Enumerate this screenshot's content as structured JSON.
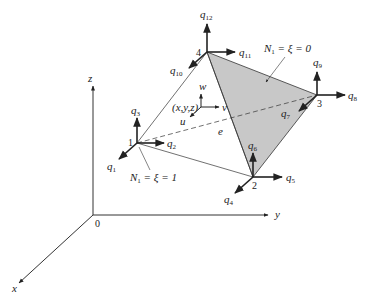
{
  "diagram": {
    "axes": {
      "origin_label": "0",
      "x_label": "x",
      "y_label": "y",
      "z_label": "z"
    },
    "nodes": [
      {
        "id": "1",
        "label": "1",
        "dofs": [
          "q1",
          "q2",
          "q3"
        ]
      },
      {
        "id": "2",
        "label": "2",
        "dofs": [
          "q4",
          "q5",
          "q6"
        ]
      },
      {
        "id": "3",
        "label": "3",
        "dofs": [
          "q7",
          "q8",
          "q9"
        ]
      },
      {
        "id": "4",
        "label": "4",
        "dofs": [
          "q10",
          "q11",
          "q12"
        ]
      }
    ],
    "dof_labels": {
      "q1": "1",
      "q2": "2",
      "q3": "3",
      "q4": "4",
      "q5": "5",
      "q6": "6",
      "q7": "7",
      "q8": "8",
      "q9": "9",
      "q10": "10",
      "q11": "11",
      "q12": "12"
    },
    "interior_point": {
      "label": "(x,y,z)",
      "u": "u",
      "v": "v",
      "w": "w"
    },
    "element_label": "e",
    "annotations": {
      "face_zero": {
        "N": "N",
        "sub": "1",
        "rest": " = ξ = 0"
      },
      "node_one": {
        "N": "N",
        "sub": "1",
        "rest": " = ξ = 1"
      }
    },
    "colors": {
      "line": "#222222",
      "shaded_face": "#c8c8c8"
    }
  }
}
